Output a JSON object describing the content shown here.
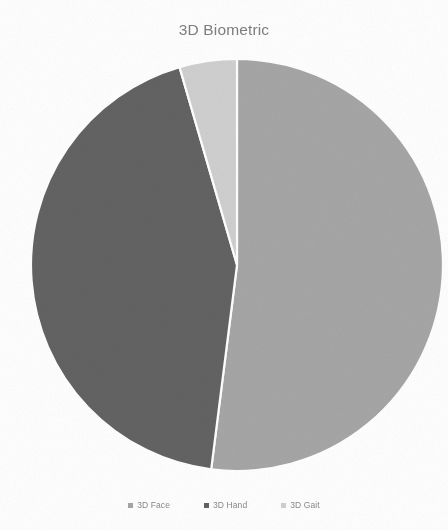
{
  "chart_data": {
    "type": "pie",
    "title": "3D Biometric",
    "xlabel": "",
    "ylabel": "",
    "categories": [
      "3D Face",
      "3D Hand",
      "3D Gait"
    ],
    "values": [
      52.0,
      43.5,
      4.5
    ],
    "colors": [
      "#a6a6a6",
      "#636363",
      "#d0d0d0"
    ],
    "legend_position": "bottom",
    "grid": false,
    "start_angle_deg": 0,
    "direction": "clockwise",
    "slices": [
      {
        "label": "3D Face",
        "value": 52.0,
        "color": "#a6a6a6",
        "start_deg": 0,
        "end_deg": 187.2
      },
      {
        "label": "3D Hand",
        "value": 43.5,
        "color": "#636363",
        "start_deg": 187.2,
        "end_deg": 343.8
      },
      {
        "label": "3D Gait",
        "value": 4.5,
        "color": "#d0d0d0",
        "start_deg": 343.8,
        "end_deg": 360
      }
    ]
  },
  "chart": {
    "title": "3D Biometric",
    "background": "#ffffff",
    "title_color": "#7f7f7f",
    "slice_border_color": "#ffffff"
  },
  "legend": {
    "items": [
      {
        "label": "3D Face",
        "color": "#a6a6a6",
        "marker": "square-marker"
      },
      {
        "label": "3D Hand",
        "color": "#636363",
        "marker": "square-marker"
      },
      {
        "label": "3D Gait",
        "color": "#d0d0d0",
        "marker": "square-marker"
      }
    ]
  }
}
